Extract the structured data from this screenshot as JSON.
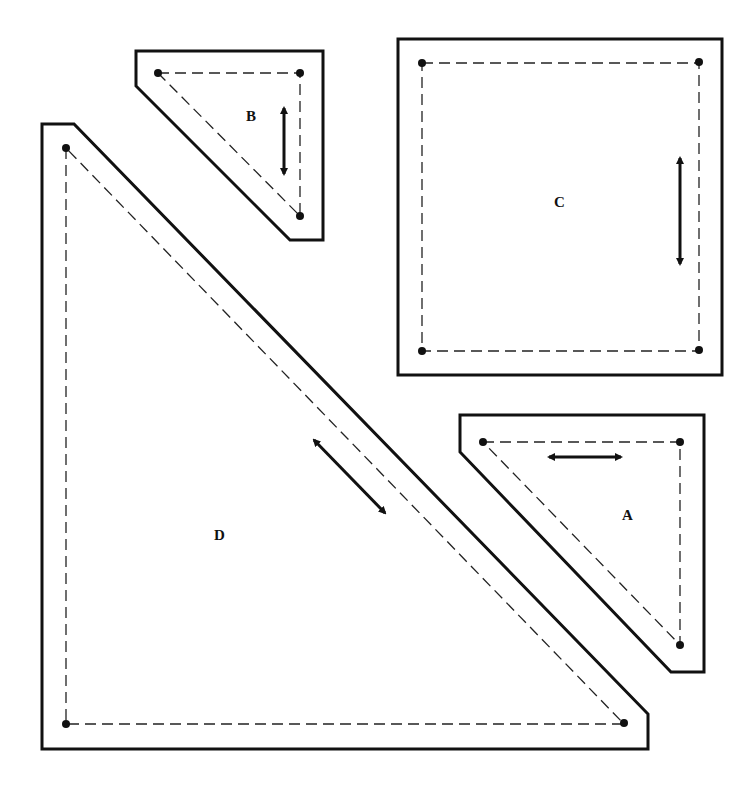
{
  "pieces": [
    {
      "id": "A",
      "label": "A",
      "grainline": "horizontal"
    },
    {
      "id": "B",
      "label": "B",
      "grainline": "vertical"
    },
    {
      "id": "C",
      "label": "C",
      "grainline": "vertical"
    },
    {
      "id": "D",
      "label": "D",
      "grainline": "diagonal"
    }
  ],
  "legend": {
    "solid_line": "cutting line",
    "dashed_line": "seam line",
    "dot": "seam corner point",
    "double_arrow": "grainline"
  },
  "colors": {
    "line": "#111111",
    "background": "#ffffff"
  }
}
